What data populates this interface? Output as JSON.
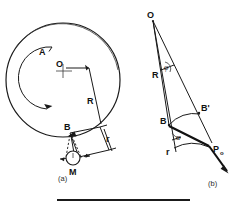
{
  "figure": {
    "background_color": "#ffffff",
    "ink_color": "#1a1a1a",
    "width": 245,
    "height": 214,
    "panels": [
      {
        "caption": "(a)",
        "caption_x": 58,
        "caption_y": 181,
        "description": "Side view of a rotating wheel of radius R about center O, with a follower roller of radius r at contact point B and center M."
      },
      {
        "caption": "(b)",
        "caption_x": 208,
        "caption_y": 186,
        "description": "Enlarged geometry showing O, radius R, angle phi, points B and B-prime, radius r, angle alpha, and contact force P0."
      }
    ],
    "panel_a": {
      "wheel_center_label": "O",
      "wheel_center_x": 63,
      "wheel_center_y": 63,
      "wheel_radius_label": "R",
      "rotation_arc_label": "A",
      "contact_point_label": "B",
      "roller_center_label": "M",
      "roller_radius_label": "r"
    },
    "panel_b": {
      "apex_label": "O",
      "radius_label": "R",
      "angle_phi_label": "φ",
      "point_b_label": "B",
      "point_b_prime_label": "B'",
      "angle_alpha_label": "α",
      "roller_radius_label": "r",
      "force_label": "P",
      "force_subscript": "o"
    },
    "footer_rule": {
      "present": true,
      "left": 57,
      "top": 199,
      "width": 133,
      "height": 2
    }
  }
}
